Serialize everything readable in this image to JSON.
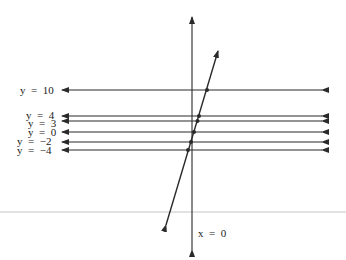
{
  "diagram": {
    "type": "graph of horizontal lines intersecting a slanted line",
    "horizontal_lines": [
      {
        "label": "y  =  10",
        "value": 10,
        "py": 90
      },
      {
        "label": "y  =  4",
        "value": 4,
        "py": 116
      },
      {
        "label": "y  =  3",
        "value": 3,
        "py": 121
      },
      {
        "label": "y  =  0",
        "value": 0,
        "py": 132
      },
      {
        "label": "y  =  −2",
        "value": -2,
        "py": 142
      },
      {
        "label": "y  =  −4",
        "value": -4,
        "py": 150
      }
    ],
    "vertical_line": {
      "label": "x  =  0"
    },
    "slanted_line": {
      "description": "line crossing each horizontal line, marked with dots at intersections"
    },
    "colors": {
      "ink": "#2a2a2a",
      "rule": "#e2e2e2",
      "background": "#ffffff"
    }
  }
}
